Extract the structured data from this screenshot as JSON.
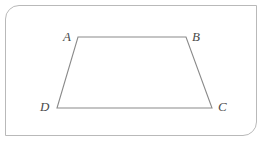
{
  "figure": {
    "type": "geometry-diagram",
    "shape_name": "trapezoid",
    "background_color": "#ffffff",
    "stroke_color": "#8a8a8a",
    "frame": {
      "border_color": "#b9b9b9",
      "rounded_corners": [
        "top-left",
        "bottom-right"
      ],
      "square_corners": [
        "top-right",
        "bottom-left"
      ]
    },
    "vertices": [
      {
        "name": "A",
        "x": 78,
        "y": 37,
        "label_position": "left-above"
      },
      {
        "name": "B",
        "x": 186,
        "y": 37,
        "label_position": "right-above"
      },
      {
        "name": "C",
        "x": 212,
        "y": 108,
        "label_position": "right-below"
      },
      {
        "name": "D",
        "x": 57,
        "y": 108,
        "label_position": "left-below"
      }
    ],
    "edges": [
      {
        "from": "A",
        "to": "B"
      },
      {
        "from": "B",
        "to": "C"
      },
      {
        "from": "C",
        "to": "D"
      },
      {
        "from": "D",
        "to": "A"
      }
    ],
    "labels": {
      "A": "A",
      "B": "B",
      "C": "C",
      "D": "D"
    }
  }
}
